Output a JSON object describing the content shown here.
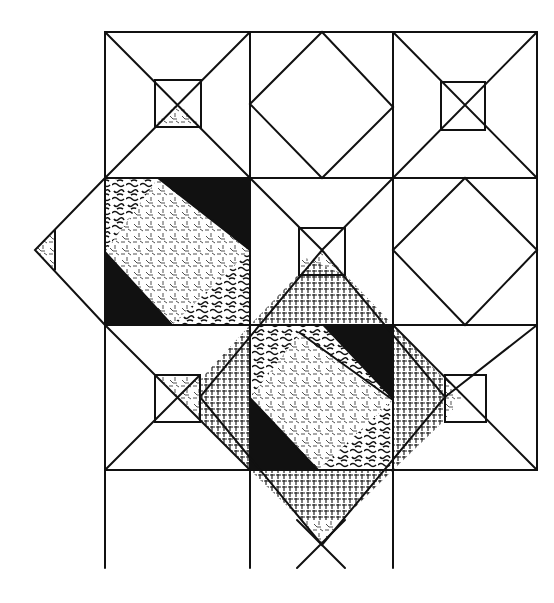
{
  "figure": {
    "grid": {
      "cols": [
        105,
        250,
        393,
        537
      ],
      "rows": [
        32,
        178,
        325,
        470
      ],
      "bottom_extension": 568
    },
    "colors": {
      "line": "#111111",
      "solid_fill": "#111111",
      "background": "#ffffff"
    },
    "fabrics": [
      "solid-black",
      "vermiculate-squiggle",
      "dash-confetti",
      "grid-weave"
    ]
  }
}
